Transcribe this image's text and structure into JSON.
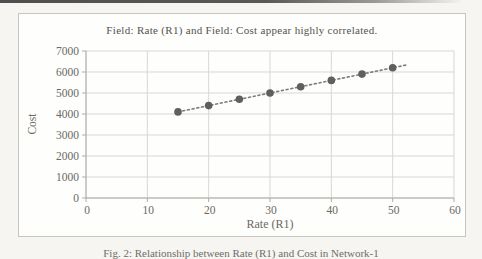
{
  "document": {
    "caption": "Fig. 2: Relationship between Rate (R1) and Cost in Network-1"
  },
  "chart": {
    "title": "Field: Rate (R1) and Field: Cost appear highly correlated.",
    "x_axis_title": "Rate (R1)",
    "y_axis_title": "Cost"
  },
  "chart_data": {
    "type": "scatter",
    "title": "Field: Rate (R1) and Field: Cost appear highly correlated.",
    "xlabel": "Rate (R1)",
    "ylabel": "Cost",
    "x": [
      15,
      20,
      25,
      30,
      35,
      40,
      45,
      50
    ],
    "y": [
      4100,
      4400,
      4700,
      5000,
      5300,
      5600,
      5900,
      6200
    ],
    "xlim": [
      0,
      60
    ],
    "ylim": [
      0,
      7000
    ],
    "xticks": [
      0,
      10,
      20,
      30,
      40,
      50,
      60
    ],
    "yticks": [
      0,
      1000,
      2000,
      3000,
      4000,
      5000,
      6000,
      7000
    ],
    "grid": true,
    "legend": "none",
    "trendline": {
      "style": "dotted",
      "slope": 60,
      "intercept": 3200,
      "x_start": 15,
      "x_end": 52.5
    },
    "colors": {
      "point": "#5f5f5f",
      "trendline": "#7d7d7d",
      "gridline": "#d9d7d3",
      "axis": "#aeaca7",
      "tick_text": "#6b6961",
      "title_text": "#54524b"
    }
  }
}
